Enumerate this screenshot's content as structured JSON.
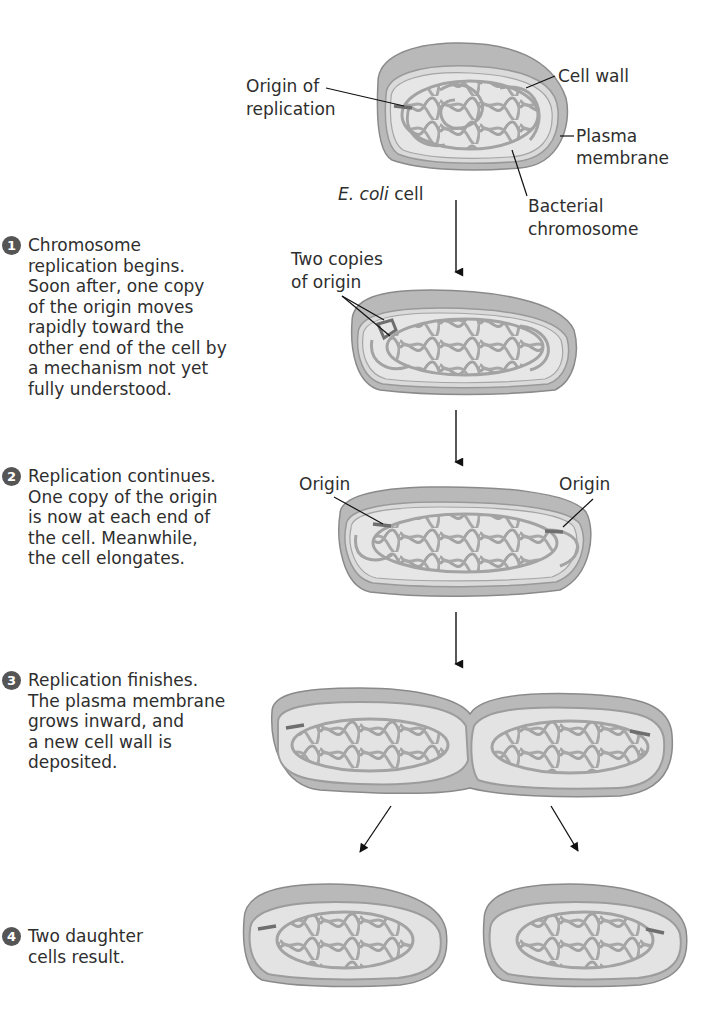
{
  "figure": {
    "colors": {
      "cell_wall": "#b9b9b9",
      "cell_wall_dark": "#8a8a8a",
      "cytoplasm": "#e4e4e4",
      "chromosome": "#a3a3a3",
      "origin": "#6e6e6e",
      "text": "#2e2e2e",
      "step_badge": "#555555"
    }
  },
  "labels": {
    "origin_of_replication": "Origin of\nreplication",
    "origin_of_replication_l1": "Origin of",
    "origin_of_replication_l2": "replication",
    "cell_wall": "Cell wall",
    "plasma_membrane_l1": "Plasma",
    "plasma_membrane_l2": "membrane",
    "ecoli_italic": "E. coli",
    "ecoli_suffix": " cell",
    "bacterial_chromosome_l1": "Bacterial",
    "bacterial_chromosome_l2": "chromosome",
    "two_copies_l1": "Two copies",
    "two_copies_l2": "of origin",
    "origin_left": "Origin",
    "origin_right": "Origin"
  },
  "steps": [
    {
      "number": "1",
      "text": "Chromosome\nreplication begins.\nSoon after, one copy\nof the origin moves\nrapidly toward the\nother end of the cell by\na mechanism not yet\nfully understood."
    },
    {
      "number": "2",
      "text": "Replication continues.\nOne copy of the origin\nis now at each end of\nthe cell. Meanwhile,\nthe cell elongates."
    },
    {
      "number": "3",
      "text": "Replication finishes.\nThe plasma membrane\ngrows inward, and\na new cell wall is\ndeposited."
    },
    {
      "number": "4",
      "text": "Two daughter\ncells result."
    }
  ]
}
